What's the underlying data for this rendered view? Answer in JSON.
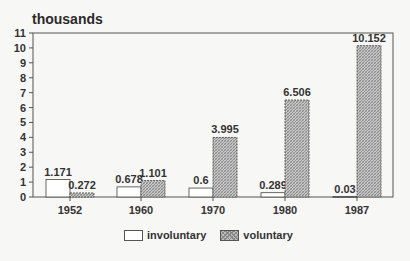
{
  "chart_data": {
    "type": "bar",
    "title": "thousands",
    "xlabel": "",
    "ylabel": "thousands",
    "categories": [
      "1952",
      "1960",
      "1970",
      "1980",
      "1987"
    ],
    "series": [
      {
        "name": "involuntary",
        "values": [
          1.171,
          0.678,
          0.6,
          0.289,
          0.03
        ],
        "labels": [
          "1.171",
          "0.678",
          "0.6",
          "0.289",
          "0.03"
        ],
        "fill": "#ffffff"
      },
      {
        "name": "voluntary",
        "values": [
          0.272,
          1.101,
          3.995,
          6.506,
          10.152
        ],
        "labels": [
          "0.272",
          "1.101",
          "3.995",
          "6.506",
          "10.152"
        ],
        "fill": "hatched-gray"
      }
    ],
    "ylim": [
      0,
      11
    ],
    "yticks": [
      0,
      1,
      2,
      3,
      4,
      5,
      6,
      7,
      8,
      9,
      10,
      11
    ],
    "grid": false,
    "legend_position": "bottom"
  },
  "legend": {
    "items": [
      {
        "label": "involuntary"
      },
      {
        "label": "voluntary"
      }
    ]
  }
}
